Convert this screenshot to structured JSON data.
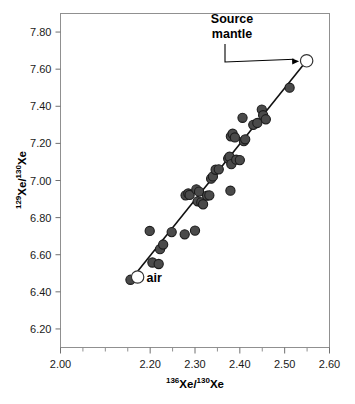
{
  "chart_data": {
    "type": "scatter",
    "title": "",
    "xlabel": "136Xe/130Xe",
    "ylabel": "129Xe/130Xe",
    "xlabel_parts": {
      "sup1": "136",
      "base1": "Xe/",
      "sup2": "130",
      "base2": "Xe"
    },
    "ylabel_parts": {
      "sup1": "129",
      "base1": "Xe/",
      "sup2": "130",
      "base2": "Xe"
    },
    "xlim": [
      2.0,
      2.6
    ],
    "ylim": [
      6.1,
      7.9
    ],
    "xticks": [
      2.0,
      2.1,
      2.2,
      2.3,
      2.4,
      2.5,
      2.6
    ],
    "xtick_labels": [
      "2.00",
      "2.20",
      "2.30",
      "2.40",
      "2.50",
      "2.60"
    ],
    "xtick_major_labeled": [
      {
        "value": 2.0,
        "label": "2.00"
      },
      {
        "value": 2.2,
        "label": "2.20"
      },
      {
        "value": 2.3,
        "label": "2.30"
      },
      {
        "value": 2.4,
        "label": "2.40"
      },
      {
        "value": 2.5,
        "label": "2.50"
      },
      {
        "value": 2.6,
        "label": "2.60"
      }
    ],
    "xtick_minor": [
      2.05,
      2.1,
      2.15,
      2.25,
      2.35,
      2.45,
      2.55
    ],
    "yticks": [
      6.2,
      6.4,
      6.6,
      6.8,
      7.0,
      7.2,
      7.4,
      7.6,
      7.8
    ],
    "ytick_labels": [
      "6.20",
      "6.40",
      "6.60",
      "6.80",
      "7.00",
      "7.20",
      "7.40",
      "7.60",
      "7.80"
    ],
    "grid": false,
    "legend": false,
    "marker_color": "#4a4a4a",
    "marker_edge_color": "#1c1c1c",
    "endmember_fill": "#ffffff",
    "line_color": "#111111",
    "frame_color": "#808080",
    "series": [
      {
        "name": "samples",
        "marker": "filled-circle",
        "points": [
          [
            2.156,
            6.465
          ],
          [
            2.199,
            6.728
          ],
          [
            2.205,
            6.558
          ],
          [
            2.219,
            6.55
          ],
          [
            2.222,
            6.63
          ],
          [
            2.229,
            6.655
          ],
          [
            2.248,
            6.722
          ],
          [
            2.277,
            6.71
          ],
          [
            2.279,
            6.92
          ],
          [
            2.285,
            6.93
          ],
          [
            2.288,
            6.922
          ],
          [
            2.3,
            6.73
          ],
          [
            2.303,
            6.952
          ],
          [
            2.306,
            6.888
          ],
          [
            2.309,
            6.94
          ],
          [
            2.314,
            6.882
          ],
          [
            2.318,
            6.872
          ],
          [
            2.327,
            6.918
          ],
          [
            2.332,
            6.92
          ],
          [
            2.336,
            7.01
          ],
          [
            2.34,
            7.022
          ],
          [
            2.346,
            7.058
          ],
          [
            2.353,
            7.06
          ],
          [
            2.374,
            7.118
          ],
          [
            2.377,
            7.128
          ],
          [
            2.379,
            6.945
          ],
          [
            2.38,
            7.238
          ],
          [
            2.381,
            7.088
          ],
          [
            2.384,
            7.252
          ],
          [
            2.389,
            7.232
          ],
          [
            2.392,
            7.112
          ],
          [
            2.4,
            7.11
          ],
          [
            2.406,
            7.338
          ],
          [
            2.409,
            7.212
          ],
          [
            2.412,
            7.222
          ],
          [
            2.43,
            7.3
          ],
          [
            2.439,
            7.31
          ],
          [
            2.449,
            7.382
          ],
          [
            2.452,
            7.352
          ],
          [
            2.458,
            7.33
          ],
          [
            2.511,
            7.5
          ]
        ]
      },
      {
        "name": "endmembers",
        "marker": "open-circle",
        "points": [
          [
            2.172,
            6.48
          ],
          [
            2.549,
            7.645
          ]
        ]
      }
    ],
    "fit_line": {
      "x0": 2.156,
      "y0": 6.462,
      "x1": 2.549,
      "y1": 7.645
    },
    "annotations": [
      {
        "name": "source-mantle",
        "text_line1": "Source",
        "text_line2": "mantle",
        "target_x": 2.549,
        "target_y": 7.645
      },
      {
        "name": "air",
        "text": "air",
        "target_x": 2.172,
        "target_y": 6.48
      }
    ]
  }
}
